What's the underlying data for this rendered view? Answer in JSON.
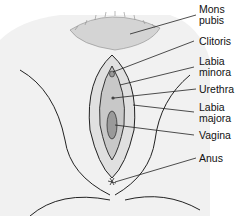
{
  "diagram": {
    "labels": [
      {
        "id": "mons-pubis",
        "line1": "Mons",
        "line2": "pubis"
      },
      {
        "id": "clitoris",
        "line1": "Clitoris"
      },
      {
        "id": "labia-minora",
        "line1": "Labia",
        "line2": "minora"
      },
      {
        "id": "urethra",
        "line1": "Urethra"
      },
      {
        "id": "labia-majora",
        "line1": "Labia",
        "line2": "majora"
      },
      {
        "id": "vagina",
        "line1": "Vagina"
      },
      {
        "id": "anus",
        "line1": "Anus"
      }
    ],
    "colors": {
      "line": "#222222",
      "shade": "#e6e6e6",
      "hair": "#9a9a9a"
    }
  }
}
